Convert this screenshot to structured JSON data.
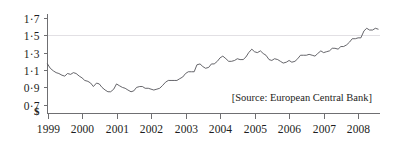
{
  "chart_data": {
    "type": "line",
    "title": "",
    "subtitle": "",
    "xlabel": "",
    "ylabel": "$",
    "ylim": [
      0.6,
      1.75
    ],
    "xlim": [
      1999.0,
      2008.62
    ],
    "grid": true,
    "gridlines_at": [
      1.5
    ],
    "legend": "none",
    "annotations": [
      {
        "id": "source",
        "text": "[Source: European Central Bank]",
        "position": "bottom-right-inside-plot"
      }
    ],
    "y_ticks": [
      0.7,
      0.9,
      1.1,
      1.3,
      1.5,
      1.7
    ],
    "y_tick_labels": [
      "0·7",
      "0·9",
      "1·1",
      "1·3",
      "1·5",
      "1·7"
    ],
    "y_axis_origin_label": "$",
    "x_ticks": [
      1999,
      2000,
      2001,
      2002,
      2003,
      2004,
      2005,
      2006,
      2007,
      2008
    ],
    "x_tick_labels": [
      "1999",
      "2000",
      "2001",
      "2002",
      "2003",
      "2004",
      "2005",
      "2006",
      "2007",
      "2008"
    ],
    "series": [
      {
        "name": "Euro exchange rate (US$ per euro)",
        "color": "#4a4a50",
        "x": [
          1999.0,
          1999.08,
          1999.17,
          1999.25,
          1999.33,
          1999.42,
          1999.5,
          1999.58,
          1999.67,
          1999.75,
          1999.83,
          1999.92,
          2000.0,
          2000.08,
          2000.17,
          2000.25,
          2000.33,
          2000.42,
          2000.5,
          2000.58,
          2000.67,
          2000.75,
          2000.83,
          2000.92,
          2001.0,
          2001.08,
          2001.17,
          2001.25,
          2001.33,
          2001.42,
          2001.5,
          2001.58,
          2001.67,
          2001.75,
          2001.83,
          2001.92,
          2002.0,
          2002.08,
          2002.17,
          2002.25,
          2002.33,
          2002.42,
          2002.5,
          2002.58,
          2002.67,
          2002.75,
          2002.83,
          2002.92,
          2003.0,
          2003.08,
          2003.17,
          2003.25,
          2003.33,
          2003.42,
          2003.5,
          2003.58,
          2003.67,
          2003.75,
          2003.83,
          2003.92,
          2004.0,
          2004.08,
          2004.17,
          2004.25,
          2004.33,
          2004.42,
          2004.5,
          2004.58,
          2004.67,
          2004.75,
          2004.83,
          2004.92,
          2005.0,
          2005.08,
          2005.17,
          2005.25,
          2005.33,
          2005.42,
          2005.5,
          2005.58,
          2005.67,
          2005.75,
          2005.83,
          2005.92,
          2006.0,
          2006.08,
          2006.17,
          2006.25,
          2006.33,
          2006.42,
          2006.5,
          2006.58,
          2006.67,
          2006.75,
          2006.83,
          2006.92,
          2007.0,
          2007.08,
          2007.17,
          2007.25,
          2007.33,
          2007.42,
          2007.5,
          2007.58,
          2007.67,
          2007.75,
          2007.83,
          2007.92,
          2008.0,
          2008.08,
          2008.17,
          2008.25,
          2008.33,
          2008.42,
          2008.5,
          2008.58
        ],
        "values": [
          1.17,
          1.12,
          1.09,
          1.07,
          1.06,
          1.04,
          1.03,
          1.06,
          1.05,
          1.07,
          1.06,
          1.03,
          1.01,
          0.98,
          0.97,
          0.95,
          0.91,
          0.95,
          0.94,
          0.9,
          0.87,
          0.85,
          0.85,
          0.88,
          0.94,
          0.92,
          0.9,
          0.89,
          0.87,
          0.85,
          0.86,
          0.9,
          0.91,
          0.91,
          0.89,
          0.89,
          0.88,
          0.87,
          0.88,
          0.89,
          0.92,
          0.96,
          0.98,
          0.98,
          0.98,
          0.98,
          1.0,
          1.02,
          1.06,
          1.08,
          1.08,
          1.08,
          1.16,
          1.17,
          1.14,
          1.12,
          1.13,
          1.17,
          1.17,
          1.2,
          1.24,
          1.26,
          1.23,
          1.2,
          1.2,
          1.21,
          1.23,
          1.22,
          1.22,
          1.25,
          1.3,
          1.34,
          1.31,
          1.3,
          1.32,
          1.29,
          1.27,
          1.22,
          1.21,
          1.23,
          1.22,
          1.2,
          1.18,
          1.19,
          1.21,
          1.19,
          1.2,
          1.23,
          1.27,
          1.27,
          1.27,
          1.28,
          1.27,
          1.26,
          1.29,
          1.32,
          1.3,
          1.31,
          1.32,
          1.35,
          1.35,
          1.34,
          1.37,
          1.37,
          1.39,
          1.42,
          1.46,
          1.46,
          1.47,
          1.47,
          1.55,
          1.58,
          1.56,
          1.56,
          1.58,
          1.57
        ]
      }
    ]
  },
  "source_note": {
    "text": "[Source: European Central Bank]"
  }
}
